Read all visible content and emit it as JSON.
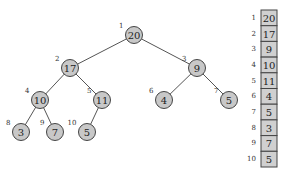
{
  "tree": {
    "nodes": [
      {
        "index": "1",
        "value": "20",
        "x": 134,
        "y": 35
      },
      {
        "index": "2",
        "value": "17",
        "x": 70,
        "y": 68
      },
      {
        "index": "3",
        "value": "9",
        "x": 197,
        "y": 68
      },
      {
        "index": "4",
        "value": "10",
        "x": 40,
        "y": 100
      },
      {
        "index": "5",
        "value": "11",
        "x": 102,
        "y": 100
      },
      {
        "index": "6",
        "value": "4",
        "x": 164,
        "y": 100
      },
      {
        "index": "7",
        "value": "5",
        "x": 229,
        "y": 100
      },
      {
        "index": "8",
        "value": "3",
        "x": 21,
        "y": 132
      },
      {
        "index": "9",
        "value": "7",
        "x": 55,
        "y": 132
      },
      {
        "index": "10",
        "value": "5",
        "x": 87,
        "y": 132
      }
    ],
    "edges": [
      [
        0,
        1
      ],
      [
        0,
        2
      ],
      [
        1,
        3
      ],
      [
        1,
        4
      ],
      [
        2,
        5
      ],
      [
        2,
        6
      ],
      [
        3,
        7
      ],
      [
        3,
        8
      ],
      [
        4,
        9
      ]
    ]
  },
  "array": {
    "cells": [
      {
        "index": "1",
        "value": "20"
      },
      {
        "index": "2",
        "value": "17"
      },
      {
        "index": "3",
        "value": "9"
      },
      {
        "index": "4",
        "value": "10"
      },
      {
        "index": "5",
        "value": "11"
      },
      {
        "index": "6",
        "value": "4"
      },
      {
        "index": "7",
        "value": "5"
      },
      {
        "index": "8",
        "value": "3"
      },
      {
        "index": "9",
        "value": "7"
      },
      {
        "index": "10",
        "value": "5"
      }
    ]
  },
  "colors": {
    "node_fill": "#c8c8c8",
    "cell_fill": "#d0d0d0",
    "stroke": "#444444"
  }
}
